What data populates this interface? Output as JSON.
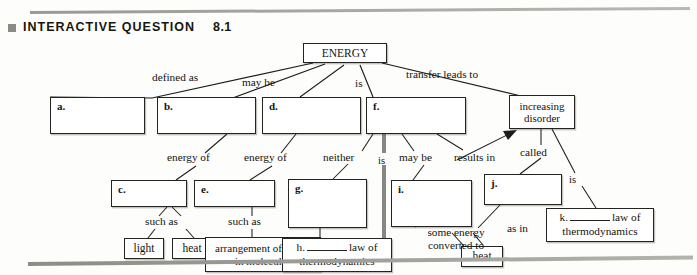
{
  "header": {
    "marker_icon": "square-bullet-icon",
    "title": "INTERACTIVE QUESTION",
    "number": "8.1"
  },
  "diagram": {
    "type": "concept-map",
    "root": {
      "id": "root",
      "label": "ENERGY"
    },
    "nodes": [
      {
        "id": "a",
        "letter": "a.",
        "text": "",
        "kind": "blank"
      },
      {
        "id": "b",
        "letter": "b.",
        "text": "",
        "kind": "blank"
      },
      {
        "id": "c",
        "letter": "c.",
        "text": "",
        "kind": "blank"
      },
      {
        "id": "d",
        "letter": "d.",
        "text": "",
        "kind": "blank"
      },
      {
        "id": "e",
        "letter": "e.",
        "text": "",
        "kind": "blank"
      },
      {
        "id": "f",
        "letter": "f.",
        "text": "",
        "kind": "blank"
      },
      {
        "id": "g",
        "letter": "g.",
        "text": "",
        "kind": "blank"
      },
      {
        "id": "i",
        "letter": "i.",
        "text": "",
        "kind": "blank"
      },
      {
        "id": "j",
        "letter": "j.",
        "text": "",
        "kind": "blank"
      },
      {
        "id": "light",
        "letter": "",
        "text": "light",
        "kind": "filled"
      },
      {
        "id": "heat1",
        "letter": "",
        "text": "heat",
        "kind": "filled"
      },
      {
        "id": "arrangement",
        "letter": "",
        "text": "arrangement of atoms in molecules",
        "kind": "filled"
      },
      {
        "id": "disorder",
        "letter": "",
        "text": "increasing disorder",
        "kind": "filled"
      },
      {
        "id": "heat2",
        "letter": "",
        "text": "heat",
        "kind": "filled"
      },
      {
        "id": "h",
        "letter": "h.",
        "text": "law of thermodynamics",
        "kind": "law"
      },
      {
        "id": "k",
        "letter": "k.",
        "text": "law of thermodynamics",
        "kind": "law"
      }
    ],
    "edge_labels": [
      {
        "id": "defined-as",
        "text": "defined as"
      },
      {
        "id": "may-be-1",
        "text": "may  be"
      },
      {
        "id": "is-1",
        "text": "is"
      },
      {
        "id": "transfer-leads-to",
        "text": "transfer leads to"
      },
      {
        "id": "energy-of-1",
        "text": "energy of"
      },
      {
        "id": "energy-of-2",
        "text": "energy of"
      },
      {
        "id": "neither",
        "text": "neither"
      },
      {
        "id": "is-2",
        "text": "is"
      },
      {
        "id": "may-be-2",
        "text": "may be"
      },
      {
        "id": "results-in",
        "text": "results in"
      },
      {
        "id": "called",
        "text": "called"
      },
      {
        "id": "is-3",
        "text": "is"
      },
      {
        "id": "such-as-1",
        "text": "such as"
      },
      {
        "id": "such-as-2",
        "text": "such as"
      },
      {
        "id": "some-energy-converted-to",
        "text": "some energy converted to"
      },
      {
        "id": "as-in",
        "text": "as in"
      }
    ],
    "law_word": "law of",
    "thermo_word": "thermodynamics"
  }
}
